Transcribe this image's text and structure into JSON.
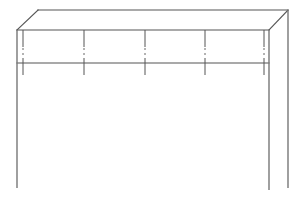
{
  "drawing": {
    "subject": "table line drawing",
    "colors": {
      "background": "#ffffff",
      "line": "#555555",
      "leg_line": "#777777"
    },
    "top": {
      "back_left": [
        38,
        10
      ],
      "back_right": [
        288,
        10
      ],
      "front_left": [
        17,
        30
      ],
      "front_right": [
        269,
        30
      ]
    },
    "apron": {
      "bottom_y": 63,
      "x_start": 17,
      "x_end": 269
    },
    "legs": [
      {
        "name": "front-left",
        "x": 17,
        "y_top": 30,
        "y_bottom": 188
      },
      {
        "name": "front-right",
        "x": 269,
        "y_top": 30,
        "y_bottom": 190
      },
      {
        "name": "back-right",
        "x": 288,
        "y_top": 10,
        "y_bottom": 188
      }
    ],
    "dividers_x": [
      23,
      84,
      145,
      205,
      264
    ]
  }
}
